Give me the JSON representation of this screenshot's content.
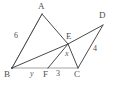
{
  "diagram": {
    "type": "euclidean-geometry-figure",
    "stroke_color": "#4a4a4a",
    "faint_stroke_color": "#9b9b9b",
    "background_color": "#ffffff",
    "vertices": [
      {
        "id": "A",
        "label": "A",
        "x": 42,
        "y": 14
      },
      {
        "id": "B",
        "label": "B",
        "x": 12,
        "y": 68
      },
      {
        "id": "C",
        "label": "C",
        "x": 78,
        "y": 68
      },
      {
        "id": "D",
        "label": "D",
        "x": 103,
        "y": 25
      },
      {
        "id": "E",
        "label": "E",
        "x": 68,
        "y": 44
      },
      {
        "id": "F",
        "label": "F",
        "x": 48,
        "y": 68
      }
    ],
    "vertex_labels": [
      {
        "name": "vertex-label-a",
        "text": "A",
        "left": 38,
        "top": 2
      },
      {
        "name": "vertex-label-b",
        "text": "B",
        "left": 4,
        "top": 70
      },
      {
        "name": "vertex-label-c",
        "text": "C",
        "left": 74,
        "top": 70
      },
      {
        "name": "vertex-label-d",
        "text": "D",
        "left": 99,
        "top": 11
      },
      {
        "name": "vertex-label-e",
        "text": "E",
        "left": 66,
        "top": 32
      },
      {
        "name": "vertex-label-f",
        "text": "F",
        "left": 43,
        "top": 70
      }
    ],
    "segment_labels": [
      {
        "name": "segment-label-ab",
        "text": "6",
        "left": 14,
        "top": 32,
        "style": "number"
      },
      {
        "name": "segment-label-bf",
        "text": "y",
        "left": 30,
        "top": 70,
        "style": "italic"
      },
      {
        "name": "segment-label-ef",
        "text": "x",
        "left": 65,
        "top": 50,
        "style": "italic"
      },
      {
        "name": "segment-label-fc",
        "text": "3",
        "left": 56,
        "top": 70,
        "style": "number"
      },
      {
        "name": "segment-label-cd",
        "text": "4",
        "left": 93,
        "top": 45,
        "style": "number"
      }
    ],
    "segments": [
      {
        "name": "segment-a-b",
        "from": "A",
        "to": "B",
        "tone": "solid"
      },
      {
        "name": "segment-a-e",
        "from": "A",
        "to": "E",
        "tone": "solid"
      },
      {
        "name": "segment-e-c",
        "from": "E",
        "to": "C",
        "tone": "solid"
      },
      {
        "name": "segment-b-e",
        "from": "B",
        "to": "E",
        "tone": "solid"
      },
      {
        "name": "segment-e-d",
        "from": "E",
        "to": "D",
        "tone": "solid"
      },
      {
        "name": "segment-e-f",
        "from": "E",
        "to": "F",
        "tone": "solid"
      },
      {
        "name": "segment-c-d",
        "from": "C",
        "to": "D",
        "tone": "solid"
      },
      {
        "name": "segment-b-f",
        "from": "B",
        "to": "F",
        "tone": "faint"
      },
      {
        "name": "segment-f-c",
        "from": "F",
        "to": "C",
        "tone": "faint"
      }
    ]
  }
}
